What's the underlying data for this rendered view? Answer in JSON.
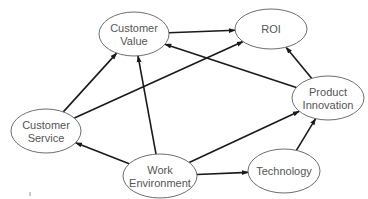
{
  "diagram": {
    "type": "directed-graph",
    "nodes": [
      {
        "id": "customer_value",
        "lines": [
          "Customer",
          "Value"
        ],
        "cx": 134,
        "cy": 34,
        "rx": 35,
        "ry": 22
      },
      {
        "id": "roi",
        "lines": [
          "ROI"
        ],
        "cx": 271,
        "cy": 29,
        "rx": 36,
        "ry": 20
      },
      {
        "id": "customer_service",
        "lines": [
          "Customer",
          "Service"
        ],
        "cx": 46,
        "cy": 131,
        "rx": 35,
        "ry": 22
      },
      {
        "id": "product_innovation",
        "lines": [
          "Product",
          "Innovation"
        ],
        "cx": 328,
        "cy": 98,
        "rx": 36,
        "ry": 22
      },
      {
        "id": "work_environment",
        "lines": [
          "Work",
          "Environment"
        ],
        "cx": 160,
        "cy": 176,
        "rx": 37,
        "ry": 22
      },
      {
        "id": "technology",
        "lines": [
          "Technology"
        ],
        "cx": 284,
        "cy": 171,
        "rx": 36,
        "ry": 22
      }
    ],
    "edges": [
      {
        "from": "customer_value",
        "to": "roi"
      },
      {
        "from": "customer_service",
        "to": "customer_value"
      },
      {
        "from": "customer_service",
        "to": "roi"
      },
      {
        "from": "product_innovation",
        "to": "customer_value"
      },
      {
        "from": "product_innovation",
        "to": "roi"
      },
      {
        "from": "work_environment",
        "to": "customer_service"
      },
      {
        "from": "work_environment",
        "to": "customer_value"
      },
      {
        "from": "work_environment",
        "to": "product_innovation"
      },
      {
        "from": "work_environment",
        "to": "technology"
      },
      {
        "from": "technology",
        "to": "product_innovation"
      }
    ],
    "colors": {
      "edge": "#1a1a1a",
      "node_stroke": "#6e6e6e",
      "label": "#555555"
    }
  }
}
